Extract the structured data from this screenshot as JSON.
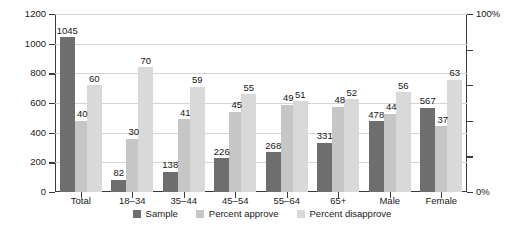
{
  "chart_data": {
    "type": "bar",
    "title": "",
    "subtitle": "",
    "xlabel": "",
    "ylabel": "",
    "categories": [
      "Total",
      "18–34",
      "35–44",
      "45–54",
      "55–64",
      "65+",
      "Male",
      "Female"
    ],
    "series": [
      {
        "name": "Sample",
        "axis": "left",
        "color": "#6e6e6e",
        "values": [
          1045,
          82,
          138,
          226,
          268,
          331,
          478,
          567
        ]
      },
      {
        "name": "Percent approve",
        "axis": "right",
        "color": "#c6c6c6",
        "values": [
          40,
          30,
          41,
          45,
          49,
          48,
          44,
          37
        ]
      },
      {
        "name": "Percent disapprove",
        "axis": "right",
        "color": "#d9d9d9",
        "values": [
          60,
          70,
          59,
          55,
          51,
          52,
          56,
          63
        ]
      }
    ],
    "yaxis_left": {
      "min": 0,
      "max": 1200,
      "step": 200,
      "ticks": [
        "0",
        "200",
        "400",
        "600",
        "800",
        "1000",
        "1200"
      ]
    },
    "yaxis_right": {
      "min": 0,
      "max": 100,
      "step": 20,
      "labeled_ticks": [
        "0%",
        "100%"
      ],
      "ticks": [
        "0%",
        "",
        "",
        "",
        "",
        "100%"
      ]
    },
    "grid": true,
    "legend_position": "bottom",
    "data_labels": true
  },
  "legend": {
    "items": [
      {
        "label": "Sample",
        "color": "#6e6e6e"
      },
      {
        "label": "Percent approve",
        "color": "#c6c6c6"
      },
      {
        "label": "Percent disapprove",
        "color": "#d9d9d9"
      }
    ]
  }
}
